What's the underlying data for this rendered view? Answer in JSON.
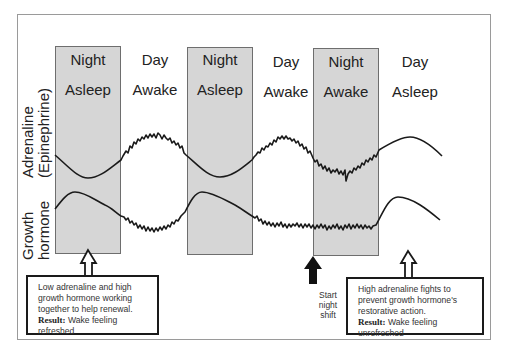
{
  "diagram": {
    "periods": [
      {
        "time": "Night",
        "state": "Asleep",
        "shaded": true
      },
      {
        "time": "Day",
        "state": "Awake",
        "shaded": false
      },
      {
        "time": "Night",
        "state": "Asleep",
        "shaded": true
      },
      {
        "time": "Day",
        "state": "Awake",
        "shaded": false
      },
      {
        "time": "Night",
        "state": "Awake",
        "shaded": true
      },
      {
        "time": "Day",
        "state": "Asleep",
        "shaded": false
      }
    ],
    "y_labels": {
      "adrenaline_line1": "Adrenaline",
      "adrenaline_line2": "(Epinephrine)",
      "growth_line1": "Growth",
      "growth_line2": "hormone"
    },
    "curves": [
      {
        "name": "Adrenaline (Epinephrine)",
        "pattern": "low during night sleep, high and jagged during day wake, jagged and elevated-low during night shift, smooth high during day sleep"
      },
      {
        "name": "Growth hormone",
        "pattern": "peaks early in night sleep, low and jagged during day wake and night shift, peaks early in day sleep"
      }
    ],
    "start_marker": {
      "line1": "Start",
      "line2": "night",
      "line3": "shift"
    },
    "notes": {
      "left": {
        "text_line1": "Low adrenaline and high",
        "text_line2": "growth hormone working",
        "text_line3": "together to help renewal.",
        "result_label": "Result:",
        "result_text_line1": " Wake feeling",
        "result_text_line2": "refreshed"
      },
      "right": {
        "text_line1": "High adrenaline fights to",
        "text_line2": "prevent growth hormone's",
        "text_line3": "restorative  action.",
        "result_label": "Result:",
        "result_text_line1": " Wake feeling",
        "result_text_line2": "unrefreshed"
      }
    },
    "colors": {
      "shade": "#d6d6d6",
      "line": "#1a1a1a",
      "frame": "#9a9a9a"
    }
  }
}
